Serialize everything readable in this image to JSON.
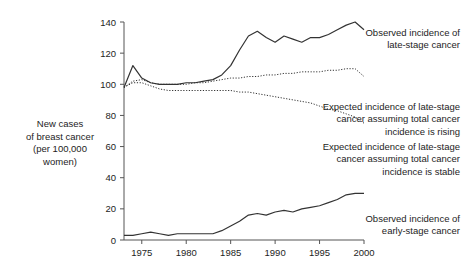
{
  "chart_data": {
    "type": "line",
    "title": "",
    "xlabel": "",
    "ylabel": "New cases of breast cancer (per 100,000 women)",
    "ylabel_lines": [
      "New cases",
      "of breast cancer",
      "(per 100,000",
      "women)"
    ],
    "xlim": [
      1973,
      2000
    ],
    "ylim": [
      0,
      140
    ],
    "ytick_values": [
      0,
      20,
      40,
      60,
      80,
      100,
      120,
      140
    ],
    "ytick_labels": [
      "0",
      "20",
      "40",
      "60",
      "80",
      "100",
      "120",
      "140"
    ],
    "xtick_values": [
      1975,
      1980,
      1985,
      1990,
      1995,
      2000
    ],
    "xtick_labels": [
      "1975",
      "1980",
      "1985",
      "1990",
      "1995",
      "2000"
    ],
    "grid": false,
    "legend_position": "annotations-right",
    "x": [
      1973,
      1974,
      1975,
      1976,
      1977,
      1978,
      1979,
      1980,
      1981,
      1982,
      1983,
      1984,
      1985,
      1986,
      1987,
      1988,
      1989,
      1990,
      1991,
      1992,
      1993,
      1994,
      1995,
      1996,
      1997,
      1998,
      1999,
      2000
    ],
    "series": [
      {
        "name": "Observed incidence of late-stage cancer",
        "style": "solid",
        "color": "#333333",
        "values": [
          98,
          112,
          104,
          101,
          100,
          100,
          100,
          101,
          101,
          102,
          103,
          106,
          112,
          122,
          131,
          134,
          130,
          127,
          131,
          129,
          127,
          130,
          130,
          132,
          135,
          138,
          140,
          135
        ]
      },
      {
        "name": "Expected incidence of late-stage cancer assuming total cancer incidence is rising",
        "style": "dotted",
        "color": "#333333",
        "values": [
          98,
          102,
          103,
          101,
          100,
          100,
          100,
          100,
          101,
          101,
          102,
          103,
          104,
          104,
          105,
          105,
          106,
          106,
          107,
          107,
          108,
          108,
          108,
          109,
          109,
          110,
          110,
          105
        ]
      },
      {
        "name": "Expected incidence of late-stage cancer assuming total cancer incidence is stable",
        "style": "dotted",
        "color": "#333333",
        "values": [
          98,
          101,
          101,
          99,
          97,
          96,
          96,
          96,
          96,
          96,
          96,
          96,
          96,
          95,
          95,
          94,
          93,
          92,
          91,
          90,
          89,
          88,
          86,
          84,
          83,
          81,
          79,
          75
        ]
      },
      {
        "name": "Observed incidence of early-stage cancer",
        "style": "solid",
        "color": "#333333",
        "values": [
          3,
          3,
          4,
          5,
          4,
          3,
          4,
          4,
          4,
          4,
          4,
          6,
          9,
          12,
          16,
          17,
          16,
          18,
          19,
          18,
          20,
          21,
          22,
          24,
          26,
          29,
          30,
          30
        ]
      }
    ],
    "annotations": [
      {
        "id": "observed-late",
        "text": "Observed incidence of\nlate-stage cancer"
      },
      {
        "id": "expected-rising",
        "text": "Expected incidence of late-stage\ncancer assuming total cancer\nincidence is rising"
      },
      {
        "id": "expected-stable",
        "text": "Expected incidence of late-stage\ncancer assuming total cancer\nincidence is stable"
      },
      {
        "id": "observed-early",
        "text": "Observed incidence of\nearly-stage cancer"
      }
    ]
  },
  "colors": {
    "background": "#ffffff",
    "ink": "#1d1d1d",
    "line": "#333333",
    "axis": "#555555"
  }
}
